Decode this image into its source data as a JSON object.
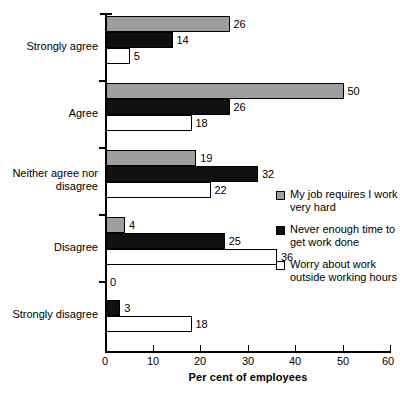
{
  "chart_data": {
    "type": "bar",
    "orientation": "horizontal",
    "title": "",
    "xlabel": "Per cent of employees",
    "ylabel": "",
    "xlim": [
      0,
      60
    ],
    "xticks": [
      0,
      10,
      20,
      30,
      40,
      50,
      60
    ],
    "xtick_labels": [
      "0",
      "10",
      "20",
      "30",
      "40",
      "50",
      "60"
    ],
    "grid": false,
    "legend_position": "right",
    "categories": [
      "Strongly agree",
      "Agree",
      "Neither agree nor disagree",
      "Disagree",
      "Strongly disagree"
    ],
    "series": [
      {
        "name": "My job requires I work very hard",
        "values": [
          26,
          50,
          19,
          4,
          0
        ],
        "color": "#9e9e9e"
      },
      {
        "name": "Never enough time to get work done",
        "values": [
          14,
          26,
          32,
          25,
          3
        ],
        "color": "#101010"
      },
      {
        "name": "Worry about work outside working hours",
        "values": [
          5,
          18,
          22,
          36,
          18
        ],
        "color": "#ffffff"
      }
    ],
    "data_labels": [
      [
        "26",
        "14",
        "5"
      ],
      [
        "50",
        "26",
        "18"
      ],
      [
        "19",
        "32",
        "22"
      ],
      [
        "4",
        "25",
        "36"
      ],
      [
        "0",
        "3",
        "18"
      ]
    ]
  },
  "legend": {
    "items": [
      {
        "label": "My job requires I work very hard",
        "swatch": "gray-square-icon"
      },
      {
        "label": "Never enough time to get work done",
        "swatch": "black-square-icon"
      },
      {
        "label": "Worry about work outside working hours",
        "swatch": "white-square-icon"
      }
    ]
  }
}
